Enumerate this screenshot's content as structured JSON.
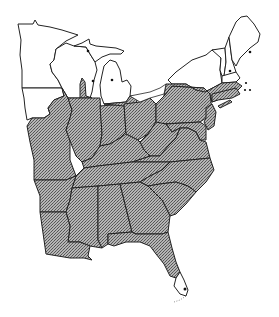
{
  "map": {
    "type": "range-map",
    "region": "Eastern United States",
    "style": "black-and-white line map with stippled (cross-hatched) gray shading",
    "colors": {
      "background": "#ffffff",
      "range_fill": "#8a8a8a",
      "range_pattern_dark": "#555555",
      "range_pattern_light": "#bdbdbd",
      "outline": "#222222",
      "point_marker": "#111111"
    },
    "legend": {
      "shaded": "range (stippled gray)",
      "dots": "isolated/disjunct records"
    },
    "unshaded_states": [
      "Minnesota",
      "Wisconsin",
      "Michigan (Upper & most of Lower Peninsula)",
      "northern Iowa",
      "New York (north)",
      "Vermont",
      "New Hampshire",
      "Maine"
    ],
    "shaded_states": [
      "southern Iowa",
      "Missouri",
      "Arkansas",
      "Louisiana",
      "Illinois",
      "Indiana",
      "Ohio",
      "Kentucky",
      "Tennessee",
      "Mississippi",
      "Alabama",
      "Georgia",
      "Florida (except southern tip)",
      "South Carolina",
      "North Carolina",
      "Virginia",
      "West Virginia",
      "Maryland",
      "Delaware",
      "New Jersey",
      "Pennsylvania",
      "southern New York",
      "Connecticut",
      "Rhode Island",
      "Massachusetts (south)",
      "southern Michigan edge",
      "southern Wisconsin tongue"
    ],
    "point_records": [
      {
        "label": "Upper Peninsula Michigan",
        "x": 88,
        "y": 51
      },
      {
        "label": "Wisconsin / Door peninsula",
        "x": 93,
        "y": 81
      },
      {
        "label": "Lower Michigan",
        "x": 112,
        "y": 80
      },
      {
        "label": "New Hampshire",
        "x": 230,
        "y": 71
      },
      {
        "label": "Maine",
        "x": 250,
        "y": 52
      },
      {
        "label": "Massachusetts coast",
        "x": 246,
        "y": 83
      },
      {
        "label": "Cape Cod islands 1",
        "x": 245,
        "y": 90
      },
      {
        "label": "Cape Cod islands 2",
        "x": 250,
        "y": 90
      },
      {
        "label": "South Florida",
        "x": 185,
        "y": 289
      }
    ]
  }
}
